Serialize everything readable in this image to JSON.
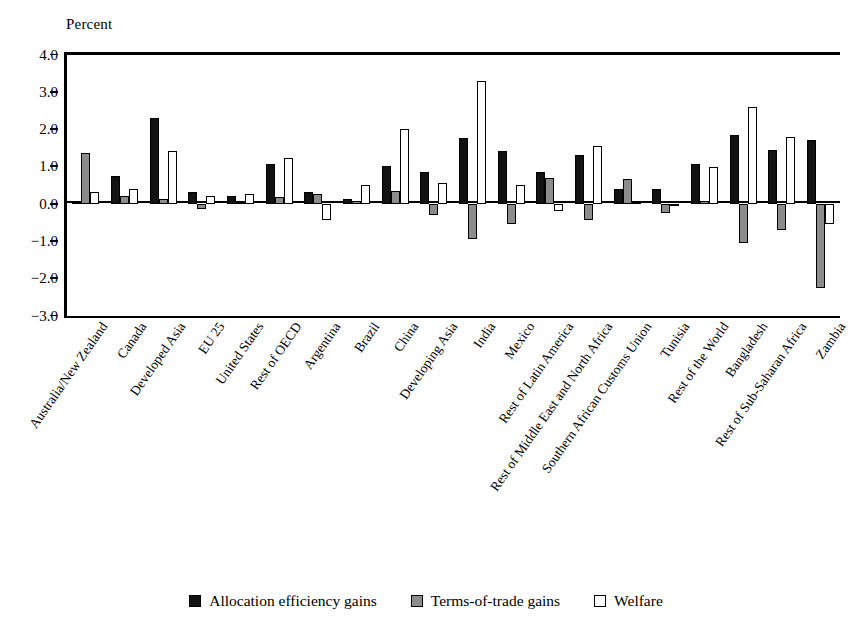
{
  "chart_data": {
    "type": "bar",
    "title": "",
    "ylabel": "Percent",
    "xlabel": "",
    "ylim": [
      -3.0,
      4.0
    ],
    "yticks": [
      "4.0",
      "3.0",
      "2.0",
      "1.0",
      "0.0",
      "−1.0",
      "−2.0",
      "−3.0"
    ],
    "ytick_values": [
      4.0,
      3.0,
      2.0,
      1.0,
      0.0,
      -1.0,
      -2.0,
      -3.0
    ],
    "grid": false,
    "legend_position": "bottom",
    "categories": [
      "Australia/New Zealand",
      "Canada",
      "Developed Asia",
      "EU 25",
      "United States",
      "Rest of OECD",
      "Argentina",
      "Brazil",
      "China",
      "Developing Asia",
      "India",
      "Mexico",
      "Rest of Latin America",
      "Rest of Middle East and North Africa",
      "Southern African Customs Union",
      "Tunisia",
      "Rest of the World",
      "Bangladesh",
      "Rest of Sub-Saharan Africa",
      "Zambia"
    ],
    "series": [
      {
        "name": "Allocation efficiency gains",
        "color": "#121212",
        "values": [
          0.05,
          0.75,
          2.3,
          0.3,
          0.2,
          1.05,
          0.3,
          0.12,
          1.0,
          0.85,
          1.75,
          1.4,
          0.85,
          1.3,
          0.4,
          0.4,
          1.05,
          1.85,
          1.45,
          1.72
        ]
      },
      {
        "name": "Terms-of-trade gains",
        "color": "#8c8c8c",
        "values": [
          1.35,
          0.2,
          0.12,
          -0.15,
          0.05,
          0.18,
          0.25,
          0.06,
          0.35,
          -0.3,
          -0.95,
          -0.55,
          0.7,
          -0.45,
          0.65,
          -0.25,
          0.08,
          -1.05,
          -0.7,
          -2.25
        ]
      },
      {
        "name": "Welfare",
        "color": "#ffffff",
        "values": [
          0.3,
          0.4,
          1.4,
          0.2,
          0.25,
          1.22,
          -0.45,
          0.5,
          2.0,
          0.55,
          3.3,
          0.5,
          -0.2,
          1.55,
          0.05,
          -0.02,
          0.98,
          2.6,
          1.8,
          -0.55
        ]
      }
    ]
  },
  "legend": {
    "items": [
      {
        "label": "Allocation efficiency gains",
        "swatch": "black-square-icon"
      },
      {
        "label": "Terms-of-trade gains",
        "swatch": "gray-square-icon"
      },
      {
        "label": "Welfare",
        "swatch": "white-square-icon"
      }
    ]
  }
}
